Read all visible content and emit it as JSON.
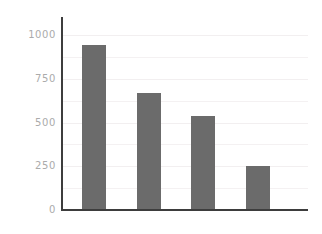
{
  "chart_data": {
    "type": "bar",
    "title": "",
    "subtitle": "",
    "xlabel": "",
    "ylabel": "",
    "categories": [
      "1",
      "2",
      "3",
      "4"
    ],
    "values": [
      943,
      669,
      537,
      251
    ],
    "series": [
      {
        "name": "series-1",
        "values": [
          943,
          669,
          537,
          251
        ]
      }
    ],
    "ylim": [
      0,
      1000
    ],
    "y_ticks": [
      0,
      250,
      500,
      750,
      1000
    ],
    "y_tick_labels": [
      "0",
      "250",
      "500",
      "750",
      "1000"
    ],
    "x_tick_labels": [
      "",
      "",
      "",
      ""
    ],
    "grid": true,
    "grid_axis": "y",
    "grid_interval": 125,
    "gridline_values": [
      125,
      250,
      375,
      500,
      625,
      750,
      875,
      1000
    ],
    "legend": false,
    "legend_position": "none",
    "annotations": [],
    "colors": {
      "bar": "#6b6b6b",
      "axis": "#3d3d3d",
      "gridline": "#f4f1f2",
      "tick_label": "#ababab",
      "background": "#ffffff"
    }
  }
}
